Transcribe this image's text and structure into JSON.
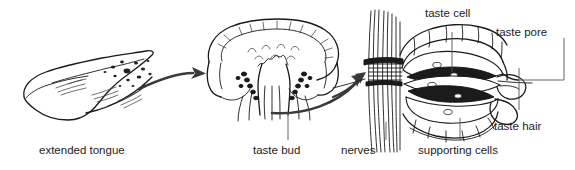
{
  "figure": {
    "background_color": "#ffffff",
    "ink_color": "#1a1a1a",
    "leader_color": "#555555",
    "arrow_color": "#3a3a3a"
  },
  "panels": {
    "tongue": {
      "caption": "extended tongue"
    },
    "papilla": {
      "caption": "taste bud"
    },
    "taste_bud_detail": {
      "labels": {
        "taste_cell": "taste cell",
        "taste_pore": "taste pore",
        "taste_hair": "taste hair",
        "nerves": "nerves",
        "supporting_cells": "supporting cells"
      }
    }
  },
  "labels": [
    {
      "id": "extended-tongue",
      "text": "extended tongue"
    },
    {
      "id": "taste-bud",
      "text": "taste bud"
    },
    {
      "id": "nerves",
      "text": "nerves"
    },
    {
      "id": "supporting-cells",
      "text": "supporting cells"
    },
    {
      "id": "taste-cell",
      "text": "taste cell"
    },
    {
      "id": "taste-pore",
      "text": "taste pore"
    },
    {
      "id": "taste-hair",
      "text": "taste hair"
    }
  ]
}
